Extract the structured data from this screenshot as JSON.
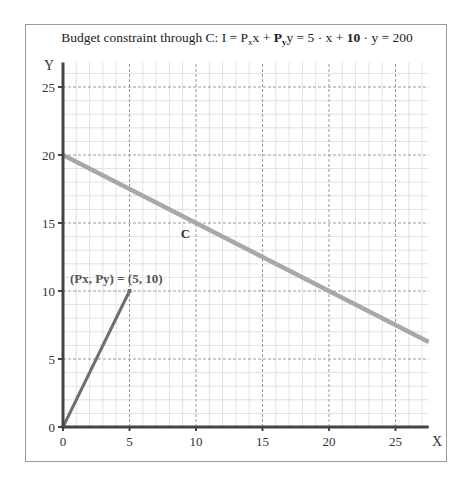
{
  "chart_data": {
    "type": "line",
    "title": {
      "prefix": "Budget constraint through C: I = P",
      "sub_x": "x",
      "mid1": "x + ",
      "bold_py": "P",
      "sub_y": "y",
      "mid2": "y = 5 · x + ",
      "bold_10": "10",
      "suffix": " · y = 200"
    },
    "xlabel": "X",
    "ylabel": "Y",
    "xlim": [
      0,
      27.5
    ],
    "ylim": [
      0,
      26.8
    ],
    "x_ticks": [
      0,
      5,
      10,
      15,
      20,
      25
    ],
    "y_ticks": [
      0,
      5,
      10,
      15,
      20,
      25
    ],
    "x_tick_labels": [
      "0",
      "5",
      "10",
      "15",
      "20",
      "25"
    ],
    "y_tick_labels": [
      "0",
      "5",
      "10",
      "15",
      "20",
      "25"
    ],
    "grid": {
      "major_step": 5,
      "minor_step": 1,
      "on": true
    },
    "series": [
      {
        "name": "C",
        "kind": "budget-line",
        "equation": "5x + 10y = 200",
        "x": [
          0,
          27.5
        ],
        "y": [
          20,
          6.25
        ],
        "color": "#a8a8a8",
        "label": "C",
        "label_at": [
          9.2,
          13.9
        ]
      },
      {
        "name": "price-vector",
        "kind": "vector",
        "x": [
          0,
          5
        ],
        "y": [
          0,
          10
        ],
        "color": "#6e6e6e",
        "label": "(Px, Py) = (5, 10)",
        "label_at": [
          4.0,
          10.6
        ]
      }
    ],
    "colors": {
      "axis": "#444444",
      "major_grid": "#9a9a9a",
      "minor_grid": "#e2e2e2",
      "frame": "#9a9a9a"
    }
  }
}
